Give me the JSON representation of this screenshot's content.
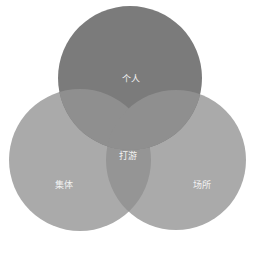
{
  "diagram": {
    "type": "venn",
    "sets": [
      {
        "label": "个人",
        "color": "#7b7b7b"
      },
      {
        "label": "集体",
        "color": "#aaaaaa"
      },
      {
        "label": "场所",
        "color": "#aaaaaa"
      }
    ],
    "intersection_label": "打游",
    "overlap_color": "#939393"
  }
}
